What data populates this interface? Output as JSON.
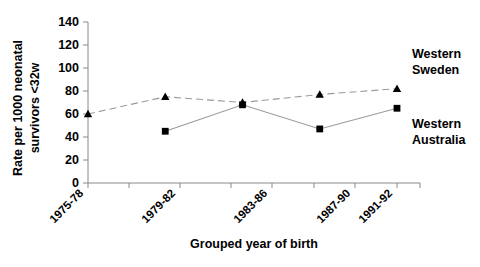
{
  "chart_data": {
    "type": "line",
    "title": "",
    "xlabel": "Grouped year of birth",
    "ylabel": "Rate per 1000 neonatal survivors <32w",
    "ylabel_line1": "Rate per 1000 neonatal",
    "ylabel_line2": "survivors <32w",
    "categories": [
      "1975-78",
      "1979-82",
      "1983-86",
      "1987-90",
      "1991-92"
    ],
    "ylim": [
      0,
      140
    ],
    "yticks": [
      0,
      20,
      40,
      60,
      80,
      100,
      120,
      140
    ],
    "ytick_labels": [
      "0",
      "20",
      "40",
      "60",
      "80",
      "100",
      "120",
      "140"
    ],
    "grid": false,
    "legend_position": "inline-right",
    "series": [
      {
        "name": "Western Sweden",
        "label_line1": "Western",
        "label_line2": "Sweden",
        "marker": "triangle",
        "linestyle": "dashed",
        "color": "#000000",
        "values": [
          60,
          75,
          70,
          77,
          82
        ]
      },
      {
        "name": "Western Australia",
        "label_line1": "Western",
        "label_line2": "Australia",
        "marker": "square",
        "linestyle": "solid",
        "color": "#000000",
        "values": [
          null,
          45,
          68,
          47,
          65
        ]
      }
    ]
  },
  "colors": {
    "background": "#ffffff",
    "axis": "#8a8a8a",
    "line": "#9a9a9a",
    "marker": "#000000",
    "text": "#000000"
  }
}
